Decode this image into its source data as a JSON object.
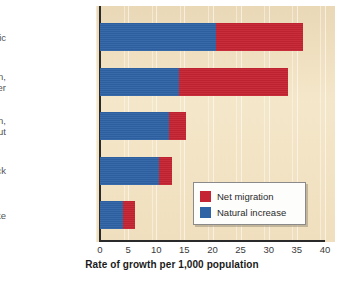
{
  "chart_data": {
    "type": "bar",
    "orientation": "horizontal",
    "stacked": true,
    "title": "",
    "xlabel": "Rate of growth per 1,000 population",
    "ylabel": "",
    "xlim": [
      0,
      40
    ],
    "xticks": [
      0,
      5,
      10,
      15,
      20,
      25,
      30,
      35,
      40
    ],
    "grid": "vertical-light",
    "legend_position": "inside-lower-right",
    "categories": [
      "Hispanic",
      "Asian, Pacific Islander",
      "American Indian, Eskimo, Aleut",
      "Black",
      "White"
    ],
    "category_lines": [
      [
        "Hispanic"
      ],
      [
        "Asian,",
        "Pacific Islander"
      ],
      [
        "American Indian,",
        "Eskimo, Aleut"
      ],
      [
        "Black"
      ],
      [
        "White"
      ]
    ],
    "series": [
      {
        "name": "Natural increase",
        "color": "#2f63a6",
        "values": [
          20.7,
          14.0,
          12.3,
          10.4,
          4.1
        ]
      },
      {
        "name": "Net migration",
        "color": "#c52432",
        "values": [
          15.3,
          19.5,
          2.9,
          2.4,
          2.2
        ]
      }
    ],
    "totals": [
      36.0,
      33.5,
      15.2,
      12.8,
      6.3
    ]
  },
  "legend": {
    "items": [
      {
        "label": "Net migration",
        "color": "#c52432"
      },
      {
        "label": "Natural increase",
        "color": "#2f63a6"
      }
    ]
  },
  "colors": {
    "natural_increase": "#2f63a6",
    "net_migration": "#c52432",
    "panel_background": "#f4e6c8",
    "page_background": "#ffffff",
    "axis": "#2a2a2a",
    "label_text": "#545454"
  },
  "axis_ticks": {
    "labels": [
      "0",
      "5",
      "10",
      "15",
      "20",
      "25",
      "30",
      "35",
      "40"
    ]
  }
}
